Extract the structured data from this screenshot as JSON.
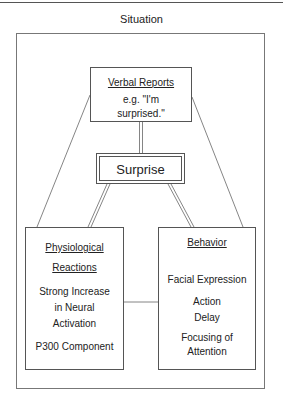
{
  "diagram": {
    "title": "Situation",
    "center": {
      "label": "Surprise"
    },
    "verbal_reports": {
      "heading": "Verbal Reports",
      "example_line1": "e.g. \"I'm",
      "example_line2": "surprised.\""
    },
    "physiological": {
      "heading_line1": "Physiological",
      "heading_line2": "Reactions",
      "item1_line1": "Strong Increase",
      "item1_line2": "in Neural",
      "item1_line3": "Activation",
      "item2": "P300 Component"
    },
    "behavior": {
      "heading": "Behavior",
      "item1": "Facial Expression",
      "item2_line1": "Action",
      "item2_line2": "Delay",
      "item3_line1": "Focusing of",
      "item3_line2": "Attention"
    },
    "connections": [
      {
        "from": "Verbal Reports",
        "to": "Surprise",
        "style": "double"
      },
      {
        "from": "Surprise",
        "to": "Physiological Reactions",
        "style": "double"
      },
      {
        "from": "Surprise",
        "to": "Behavior",
        "style": "double"
      },
      {
        "from": "Verbal Reports",
        "to": "Physiological Reactions",
        "style": "single"
      },
      {
        "from": "Verbal Reports",
        "to": "Behavior",
        "style": "single"
      },
      {
        "from": "Physiological Reactions",
        "to": "Behavior",
        "style": "single"
      }
    ]
  }
}
